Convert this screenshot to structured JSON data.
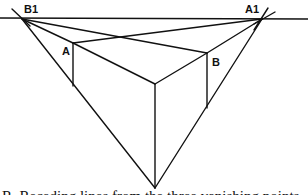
{
  "diagram": {
    "colors": {
      "line": "#111111",
      "background": "#ffffff"
    },
    "labels": {
      "vp_left": "B1",
      "vp_right": "A1",
      "corner_left": "A",
      "corner_right": "B"
    },
    "points": {
      "B1": [
        22,
        19
      ],
      "A1": [
        262,
        19
      ],
      "VP3": [
        155,
        188
      ],
      "front_top": [
        155,
        84
      ],
      "A_top": [
        73,
        43
      ],
      "B_top": [
        207,
        53
      ],
      "front_bottom": [
        155,
        170
      ],
      "A_bottom": [
        73,
        86
      ],
      "B_bottom": [
        207,
        108
      ]
    },
    "horizon": {
      "y": 18,
      "x_start": 0,
      "x_end": 308
    },
    "caption_partial": "R. Receding lines from the three vanishing points"
  }
}
